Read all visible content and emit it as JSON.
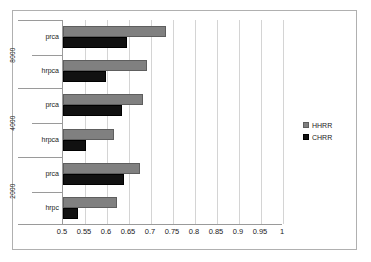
{
  "chart_data": {
    "type": "bar",
    "orientation": "horizontal",
    "title": "",
    "xlabel": "",
    "ylabel": "",
    "xlim": [
      0.5,
      1
    ],
    "xticks": [
      "0.5",
      "0.55",
      "0.6",
      "0.65",
      "0.7",
      "0.75",
      "0.8",
      "0.85",
      "0.9",
      "0.95",
      "1"
    ],
    "xtick_values": [
      0.5,
      0.55,
      0.6,
      0.65,
      0.7,
      0.75,
      0.8,
      0.85,
      0.9,
      0.95,
      1
    ],
    "grid": true,
    "legend_position": "right",
    "legend": [
      "HHRR",
      "CHRR"
    ],
    "colors": {
      "HHRR": "#808080",
      "CHRR": "#111111",
      "gridline": "#d4d4d4",
      "axis": "#9a9a9a",
      "frame": "#b0b0b0",
      "background": "#ffffff"
    },
    "groups": [
      {
        "label": "8000",
        "categories": [
          {
            "label": "prca",
            "values": {
              "HHRR": 0.735,
              "CHRR": 0.645
            }
          },
          {
            "label": "hrpca",
            "values": {
              "HHRR": 0.69,
              "CHRR": 0.597
            }
          }
        ]
      },
      {
        "label": "4000",
        "categories": [
          {
            "label": "prca",
            "values": {
              "HHRR": 0.682,
              "CHRR": 0.633
            }
          },
          {
            "label": "hrpca",
            "values": {
              "HHRR": 0.615,
              "CHRR": 0.553
            }
          }
        ]
      },
      {
        "label": "2000",
        "categories": [
          {
            "label": "prca",
            "values": {
              "HHRR": 0.676,
              "CHRR": 0.638
            }
          },
          {
            "label": "hrpc",
            "values": {
              "HHRR": 0.622,
              "CHRR": 0.533
            }
          }
        ]
      }
    ],
    "series": [
      {
        "name": "HHRR",
        "values": [
          0.735,
          0.69,
          0.682,
          0.615,
          0.676,
          0.622
        ]
      },
      {
        "name": "CHRR",
        "values": [
          0.645,
          0.597,
          0.633,
          0.553,
          0.638,
          0.533
        ]
      }
    ],
    "categories": [
      "8000 / prca",
      "8000 / hrpca",
      "4000 / prca",
      "4000 / hrpca",
      "2000 / prca",
      "2000 / hrpc"
    ]
  }
}
